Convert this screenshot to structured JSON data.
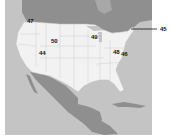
{
  "map": {
    "region": "North America",
    "colors": {
      "ocean": "#c4c4c4",
      "foreign_land": "#8f8f8f",
      "usa_land": "#f2f2f2",
      "state_border": "#bdbdbd",
      "label_text": "#111111",
      "background": "#ffffff"
    },
    "labels": [
      {
        "id": "47",
        "text": "47",
        "x": 27,
        "y": 20
      },
      {
        "id": "50",
        "text": "50",
        "x": 51,
        "y": 39
      },
      {
        "id": "44",
        "text": "44",
        "x": 39,
        "y": 51
      },
      {
        "id": "49",
        "text": "49",
        "x": 91,
        "y": 35
      },
      {
        "id": "48",
        "text": "48",
        "x": 113,
        "y": 50
      },
      {
        "id": "46",
        "text": "46",
        "x": 121,
        "y": 52
      },
      {
        "id": "45",
        "text": "45",
        "x": 160,
        "y": 27
      }
    ],
    "leader_line": {
      "x1": 131,
      "y1": 29,
      "x2": 157,
      "y2": 29
    }
  }
}
